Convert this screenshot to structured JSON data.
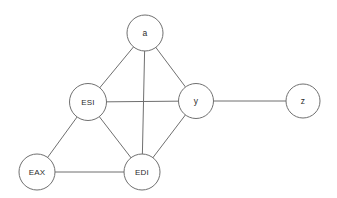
{
  "diagram": {
    "type": "undirected-graph",
    "background_color": "#ffffff",
    "node_stroke_color": "#707070",
    "node_fill_color": "#ffffff",
    "edge_color": "#6f6f6f",
    "label_color": "#2b2b2b",
    "canvas": {
      "width": 337,
      "height": 198
    },
    "nodes": [
      {
        "id": "a",
        "label": "a",
        "cx": 145,
        "cy": 33,
        "r": 18.0
      },
      {
        "id": "ESI",
        "label": "ESI",
        "cx": 88,
        "cy": 102,
        "r": 18.5
      },
      {
        "id": "y",
        "label": "y",
        "cx": 196,
        "cy": 101,
        "r": 17.5
      },
      {
        "id": "z",
        "label": "z",
        "cx": 303,
        "cy": 101,
        "r": 17.0
      },
      {
        "id": "EAX",
        "label": "EAX",
        "cx": 37,
        "cy": 172,
        "r": 18.0
      },
      {
        "id": "EDI",
        "label": "EDI",
        "cx": 142,
        "cy": 172,
        "r": 18.0
      }
    ],
    "edges": [
      {
        "from": "a",
        "to": "ESI"
      },
      {
        "from": "a",
        "to": "y"
      },
      {
        "from": "a",
        "to": "EDI"
      },
      {
        "from": "ESI",
        "to": "y"
      },
      {
        "from": "ESI",
        "to": "EAX"
      },
      {
        "from": "ESI",
        "to": "EDI"
      },
      {
        "from": "EAX",
        "to": "EDI"
      },
      {
        "from": "EDI",
        "to": "y"
      },
      {
        "from": "y",
        "to": "z"
      }
    ]
  }
}
